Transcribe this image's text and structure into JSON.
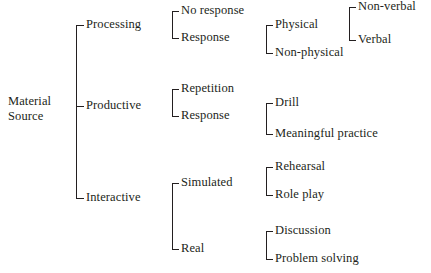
{
  "diagram": {
    "type": "tree",
    "orientation": "left-to-right",
    "background_color": "#ffffff",
    "line_color": "#231f20",
    "text_color": "#231f20",
    "root": {
      "label_line1": "Material",
      "label_line2": "Source"
    },
    "level1": [
      {
        "id": "processing",
        "label": "Processing"
      },
      {
        "id": "productive",
        "label": "Productive"
      },
      {
        "id": "interactive",
        "label": "Interactive"
      }
    ],
    "level2": [
      {
        "id": "proc-no-response",
        "parent": "processing",
        "label": "No response"
      },
      {
        "id": "proc-response",
        "parent": "processing",
        "label": "Response"
      },
      {
        "id": "prod-repetition",
        "parent": "productive",
        "label": "Repetition"
      },
      {
        "id": "prod-response",
        "parent": "productive",
        "label": "Response"
      },
      {
        "id": "inter-simulated",
        "parent": "interactive",
        "label": "Simulated"
      },
      {
        "id": "inter-real",
        "parent": "interactive",
        "label": "Real"
      }
    ],
    "level3": [
      {
        "id": "physical",
        "parent": "proc-response",
        "label": "Physical"
      },
      {
        "id": "non-physical",
        "parent": "proc-response",
        "label": "Non-physical"
      },
      {
        "id": "drill",
        "parent": "prod-response",
        "label": "Drill"
      },
      {
        "id": "meaningful-practice",
        "parent": "prod-response",
        "label": "Meaningful practice"
      },
      {
        "id": "rehearsal",
        "parent": "inter-simulated",
        "label": "Rehearsal"
      },
      {
        "id": "role-play",
        "parent": "inter-simulated",
        "label": "Role play"
      },
      {
        "id": "discussion",
        "parent": "inter-real",
        "label": "Discussion"
      },
      {
        "id": "problem-solving",
        "parent": "inter-real",
        "label": "Problem solving"
      }
    ],
    "level4": [
      {
        "id": "non-verbal",
        "parent": "physical",
        "label": "Non-verbal"
      },
      {
        "id": "verbal",
        "parent": "physical",
        "label": "Verbal"
      }
    ]
  }
}
